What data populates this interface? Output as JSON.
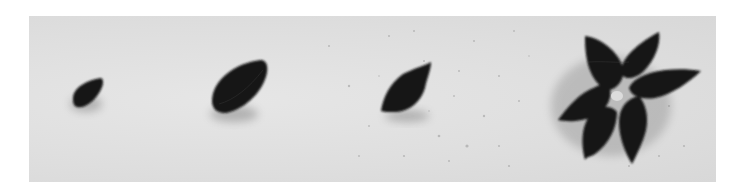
{
  "image": {
    "description": "Photograph of dark clay shapes on a speckled light surface, showing progression from a small teardrop blob to a flat leaf, a pointed petal, and a five-petal flower.",
    "background_color": "#e0e0e0",
    "clay_color": "#141414",
    "stages": [
      {
        "name": "teardrop-blob",
        "label": "Stage 1"
      },
      {
        "name": "flattened-leaf",
        "label": "Stage 2"
      },
      {
        "name": "pointed-petal",
        "label": "Stage 3"
      },
      {
        "name": "five-petal-flower",
        "label": "Stage 4"
      }
    ]
  }
}
